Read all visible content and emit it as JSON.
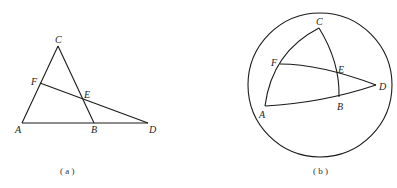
{
  "figure_a": {
    "caption": "( a )",
    "points": {
      "A": {
        "label": "A",
        "x": 22,
        "y": 123
      },
      "B": {
        "label": "B",
        "x": 94,
        "y": 123
      },
      "C": {
        "label": "C",
        "x": 58,
        "y": 46
      },
      "D": {
        "label": "D",
        "x": 148,
        "y": 123
      },
      "E": {
        "label": "E",
        "x": 82,
        "y": 98
      },
      "F": {
        "label": "F",
        "x": 40,
        "y": 83
      }
    },
    "segments": [
      [
        "A",
        "C"
      ],
      [
        "C",
        "B"
      ],
      [
        "A",
        "D"
      ],
      [
        "F",
        "D"
      ]
    ]
  },
  "figure_b": {
    "caption": "( b )",
    "sphere": {
      "cx": 320,
      "cy": 85,
      "r": 72
    },
    "points": {
      "A": {
        "label": "A",
        "x": 265,
        "y": 106
      },
      "B": {
        "label": "B",
        "x": 339,
        "y": 97
      },
      "C": {
        "label": "C",
        "x": 319,
        "y": 28
      },
      "D": {
        "label": "D",
        "x": 376,
        "y": 85
      },
      "E": {
        "label": "E",
        "x": 336,
        "y": 73
      },
      "F": {
        "label": "F",
        "x": 280,
        "y": 64
      }
    },
    "arcs": [
      [
        "A",
        "C"
      ],
      [
        "C",
        "B"
      ],
      [
        "A",
        "D"
      ],
      [
        "F",
        "D"
      ]
    ]
  }
}
